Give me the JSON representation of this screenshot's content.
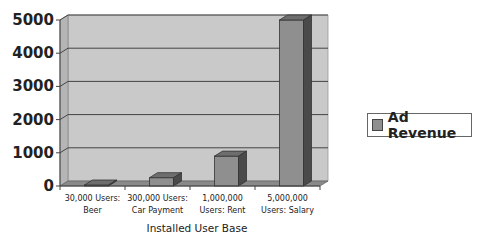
{
  "chart_data": {
    "type": "bar",
    "style": "3d-column",
    "title": "",
    "xlabel": "Installed User Base",
    "ylabel": "",
    "categories": [
      [
        "30,000 Users:",
        "Beer"
      ],
      [
        "300,000 Users:",
        "Car Payment"
      ],
      [
        "1,000,000",
        "Users: Rent"
      ],
      [
        "5,000,000",
        "Users: Salary"
      ]
    ],
    "series": [
      {
        "name": "Ad Revenue",
        "values": [
          30,
          250,
          900,
          5000
        ],
        "color": "#8f8f8f"
      }
    ],
    "ylim": [
      0,
      5000
    ],
    "yticks": [
      0,
      1000,
      2000,
      3000,
      4000,
      5000
    ],
    "grid": true,
    "legend": "right"
  }
}
